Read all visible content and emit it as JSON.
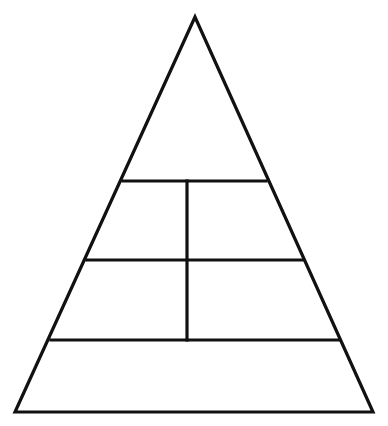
{
  "diagram": {
    "type": "pyramid",
    "stroke_color": "#111111",
    "background_color": "#ffffff",
    "outline": {
      "apex": [
        195,
        17
      ],
      "bottom_left": [
        15,
        412
      ],
      "bottom_right": [
        373,
        412
      ]
    },
    "tiers": [
      {
        "name": "top",
        "cells": 1,
        "y_top": 17,
        "y_bottom": 181
      },
      {
        "name": "upper-middle",
        "cells": 2,
        "y_top": 181,
        "y_bottom": 260
      },
      {
        "name": "lower-middle",
        "cells": 2,
        "y_top": 260,
        "y_bottom": 340
      },
      {
        "name": "base",
        "cells": 1,
        "y_top": 340,
        "y_bottom": 412
      }
    ],
    "dividers": {
      "horizontal": [
        {
          "y": 181,
          "x1": 123,
          "x2": 266
        },
        {
          "y": 260,
          "x1": 87,
          "x2": 303
        },
        {
          "y": 340,
          "x1": 51,
          "x2": 339
        }
      ],
      "vertical": [
        {
          "x": 187,
          "y1": 181,
          "y2": 340
        }
      ]
    },
    "labels": []
  }
}
